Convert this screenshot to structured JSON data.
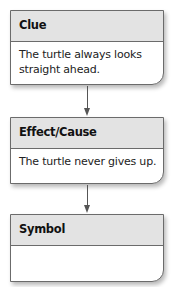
{
  "boxes": [
    {
      "title": "Clue",
      "text": "The turtle always looks straight ahead."
    },
    {
      "title": "Effect/Cause",
      "text": "The turtle never gives up."
    },
    {
      "title": "Symbol",
      "text": ""
    }
  ],
  "colors": {
    "header_bg": "#e3e3e3",
    "border": "#6b6b6b",
    "arrow": "#555555"
  }
}
